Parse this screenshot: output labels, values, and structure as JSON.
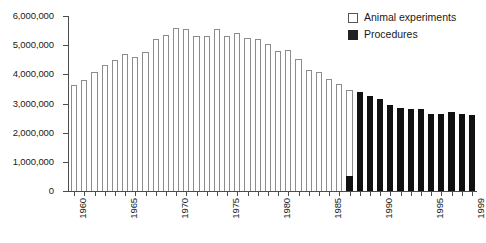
{
  "chart_data": {
    "type": "bar",
    "title": "",
    "subtitle": "",
    "xlabel": "",
    "ylabel": "",
    "ylim": [
      0,
      6000000
    ],
    "y_ticks": [
      0,
      1000000,
      2000000,
      3000000,
      4000000,
      5000000,
      6000000
    ],
    "y_tick_labels": [
      "0",
      "1,000,000",
      "2,000,000",
      "3,000,000",
      "4,000,000",
      "5,000,000",
      "6,000,000"
    ],
    "grid": false,
    "legend_position": "top-right",
    "categories": [
      "1960",
      "1961",
      "1962",
      "1963",
      "1964",
      "1965",
      "1966",
      "1967",
      "1968",
      "1969",
      "1970",
      "1971",
      "1972",
      "1973",
      "1974",
      "1975",
      "1976",
      "1977",
      "1978",
      "1979",
      "1980",
      "1981",
      "1982",
      "1983",
      "1984",
      "1985",
      "1986",
      "1987",
      "1988",
      "1989",
      "1990",
      "1991",
      "1992",
      "1993",
      "1994",
      "1995",
      "1996",
      "1997",
      "1998",
      "1999"
    ],
    "x_tick_labels": [
      "1960",
      "1965",
      "1970",
      "1975",
      "1980",
      "1985",
      "1990",
      "1995",
      "1999"
    ],
    "series": [
      {
        "name": "Animal experiments",
        "color": "#ffffff",
        "edge_color": "#8c8c8c",
        "values": [
          3650000,
          3800000,
          4080000,
          4320000,
          4480000,
          4700000,
          4580000,
          4760000,
          5220000,
          5350000,
          5580000,
          5540000,
          5320000,
          5320000,
          5550000,
          5320000,
          5430000,
          5230000,
          5200000,
          5050000,
          4800000,
          4830000,
          4530000,
          4160000,
          4080000,
          3850000,
          3680000,
          3450000,
          2950000,
          null,
          null,
          null,
          null,
          null,
          null,
          null,
          null,
          null,
          null,
          null
        ]
      },
      {
        "name": "Procedures",
        "color": "#111111",
        "edge_color": "#111111",
        "values": [
          null,
          null,
          null,
          null,
          null,
          null,
          null,
          null,
          null,
          null,
          null,
          null,
          null,
          null,
          null,
          null,
          null,
          null,
          null,
          null,
          null,
          null,
          null,
          null,
          null,
          null,
          null,
          500000,
          3400000,
          3250000,
          3150000,
          2950000,
          2850000,
          2800000,
          2820000,
          2650000,
          2650000,
          2700000,
          2650000,
          2620000
        ]
      }
    ]
  },
  "legend": {
    "items": [
      {
        "label": "Animal experiments",
        "swatch": "white-square"
      },
      {
        "label": "Procedures",
        "swatch": "black-square"
      }
    ]
  },
  "colors": {
    "axis": "#4d4d4d",
    "animal_fill": "#ffffff",
    "animal_edge": "#8c8c8c",
    "procedures_fill": "#111111",
    "background": "#ffffff",
    "text": "#1a1a1a"
  }
}
